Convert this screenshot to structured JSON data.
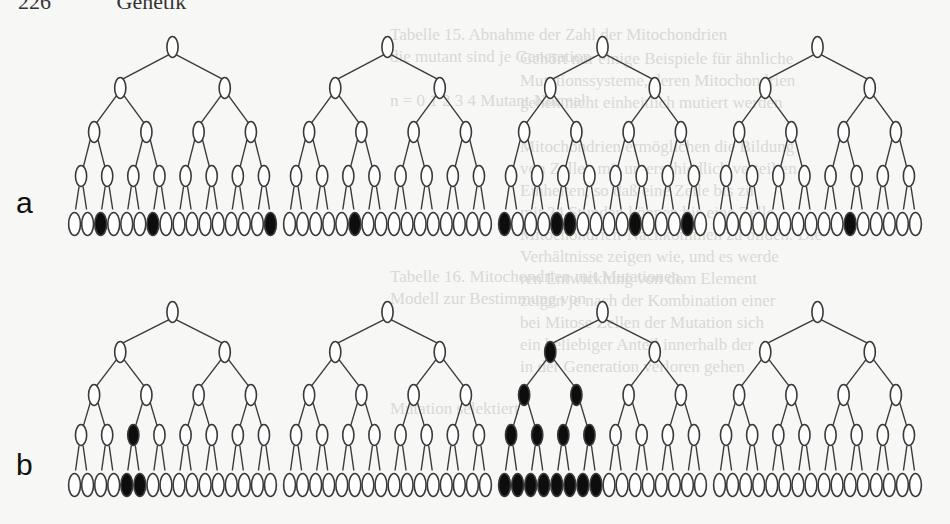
{
  "header": {
    "page_number": "226",
    "chapter": "Genetik"
  },
  "bleed_through": {
    "col1": [
      "Tabelle 15. Abnahme der Zahl der Mitochondrien",
      "die mutant sind je Generation",
      "",
      "n = 0   1   2   3   4   Mutant   Normal",
      "",
      "",
      "",
      "",
      "",
      "",
      "",
      "Tabelle 16. Mitochondrien mit Mutationen,",
      "Modell zur Bestimmung von",
      "",
      "",
      "",
      "",
      "Mutation selektiert"
    ],
    "col2": [
      "Gehört nur einige Beispiele für ähnliche",
      "Mutationssysteme, deren Mitochondrien",
      "gehen nicht einheitlich mutiert werden",
      "",
      "Mitochondrien ermöglichen die Bildung",
      "von Zellen mit unterschiedlich verteilten",
      "Einheiten, so daß eine Zelle bis zu",
      "mit 24 Stunden können bis eine Zelle",
      "Mitochondrien-Nachkommen zu bilden. Die",
      "Verhältnisse zeigen wie, und es werde",
      "ren Entwicklung von dem Element",
      "zeigen je nach der Kombination einer",
      "bei Mitose Zellen der Mutation sich",
      "ein beliebiger Anteil innerhalb der",
      "in der Generation verloren gehen"
    ]
  },
  "labels": {
    "row_a": "a",
    "row_b": "b"
  },
  "colors": {
    "stroke": "#3a3a3a",
    "filled": "#0d0d0d",
    "empty": "#ffffff",
    "background": "#f7f7f5"
  },
  "diagram": {
    "rows": [
      {
        "label": "a",
        "level_y": [
          47,
          88,
          132,
          176,
          224
        ],
        "trees": [
          {
            "x0": 68,
            "x1": 277,
            "filled": [
              [],
              [],
              [],
              [],
              [
                2,
                6,
                15
              ]
            ]
          },
          {
            "x0": 283,
            "x1": 492,
            "filled": [
              [],
              [],
              [],
              [],
              [
                5
              ]
            ]
          },
          {
            "x0": 498,
            "x1": 707,
            "filled": [
              [],
              [],
              [],
              [],
              [
                0,
                4,
                5,
                10,
                14
              ]
            ]
          },
          {
            "x0": 713,
            "x1": 922,
            "filled": [
              [],
              [],
              [],
              [],
              [
                10
              ]
            ]
          }
        ]
      },
      {
        "label": "b",
        "level_y": [
          312,
          352,
          395,
          435,
          485
        ],
        "trees": [
          {
            "x0": 68,
            "x1": 277,
            "filled": [
              [],
              [],
              [],
              [
                2
              ],
              [
                4,
                5
              ]
            ]
          },
          {
            "x0": 283,
            "x1": 492,
            "filled": [
              [],
              [],
              [],
              [],
              []
            ]
          },
          {
            "x0": 498,
            "x1": 707,
            "filled": [
              [],
              [
                0
              ],
              [
                0,
                1
              ],
              [
                0,
                1,
                2,
                3
              ],
              [
                0,
                1,
                2,
                3,
                4,
                5,
                6,
                7
              ]
            ]
          },
          {
            "x0": 713,
            "x1": 922,
            "filled": [
              [],
              [],
              [],
              [],
              []
            ]
          }
        ]
      }
    ]
  }
}
